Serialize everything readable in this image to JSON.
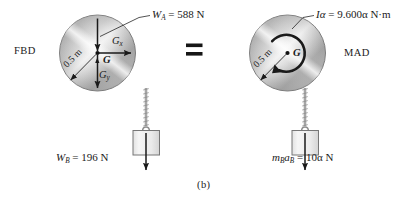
{
  "figure": {
    "caption": "(b)",
    "left_panel": {
      "name": "FBD",
      "label": "FBD",
      "disk": {
        "radius_label": "0.5 m",
        "center_label": "G"
      },
      "forces": [
        {
          "id": "weight-disk",
          "label": "W_A = 588 N",
          "label_text": "W",
          "label_sub": "A",
          "label_rest": " = 588 N",
          "direction": "down"
        },
        {
          "id": "reaction-x",
          "label": "G_x",
          "label_text": "G",
          "label_sub": "x",
          "direction": "right"
        },
        {
          "id": "reaction-y",
          "label": "G_y",
          "label_text": "G",
          "label_sub": "y",
          "direction": "down"
        },
        {
          "id": "weight-block",
          "label": "W_B = 196 N",
          "label_text": "W",
          "label_sub": "B",
          "label_rest": " = 196 N",
          "direction": "down"
        }
      ]
    },
    "operator": "=",
    "right_panel": {
      "name": "MAD",
      "label": "MAD",
      "disk": {
        "radius_label": "0.5 m",
        "center_label": "G",
        "moment_sense": "clockwise"
      },
      "kinetics": [
        {
          "id": "moment-couple",
          "label": "Iα = 9.600α N·m",
          "label_text": "Iα",
          "label_rest": " = 9.600α N·m",
          "direction": "clockwise"
        },
        {
          "id": "block-inertia-force",
          "label": "m_B a_B = 10α N",
          "label_text": "m",
          "label_sub": "B",
          "label_text2": "a",
          "label_sub2": "B",
          "label_rest": " = 10α N",
          "direction": "down"
        }
      ]
    },
    "colors": {
      "ink": "#1a1a1a",
      "disk_light": "#f2f2f2",
      "disk_mid": "#b9b9b9",
      "disk_dark": "#8e8e8e",
      "block_fill": "#ededed",
      "block_stroke": "#6e6e6e",
      "cord": "#9a9a9a",
      "background": "#ffffff"
    }
  }
}
